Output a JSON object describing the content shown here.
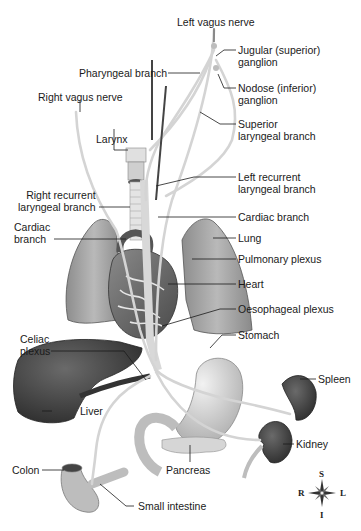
{
  "diagram": {
    "labels": {
      "left_vagus_nerve": "Left vagus nerve",
      "jugular_ganglion": "Jugular (superior)\nganglion",
      "pharyngeal_branch": "Pharyngeal branch",
      "nodose_ganglion": "Nodose (inferior)\nganglion",
      "right_vagus_nerve": "Right vagus nerve",
      "superior_laryngeal_branch": "Superior\nlaryngeal branch",
      "larynx": "Larynx",
      "left_recurrent_laryngeal_branch": "Left recurrent\nlaryngeal branch",
      "right_recurrent_laryngeal_branch": "Right recurrent\nlaryngeal branch",
      "cardiac_branch_left": "Cardiac\nbranch",
      "cardiac_branch_right": "Cardiac branch",
      "lung": "Lung",
      "pulmonary_plexus": "Pulmonary plexus",
      "heart": "Heart",
      "oesophageal_plexus": "Oesophageal plexus",
      "celiac_plexus": "Celiac\nplexus",
      "stomach": "Stomach",
      "spleen": "Spleen",
      "liver": "Liver",
      "kidney": "Kidney",
      "pancreas": "Pancreas",
      "colon": "Colon",
      "small_intestine": "Small intestine"
    },
    "compass": {
      "superior": "S",
      "inferior": "I",
      "right": "R",
      "left": "L"
    },
    "colors": {
      "nerve": "#d8d8d8",
      "organ_light": "#c9c9c9",
      "organ_dark": "#3a3a3a",
      "leader_line": "#1a1a1a"
    }
  }
}
